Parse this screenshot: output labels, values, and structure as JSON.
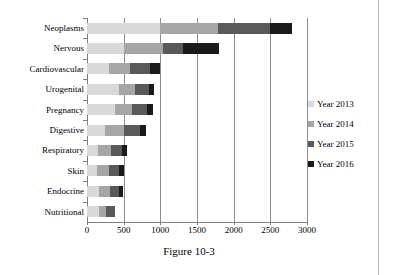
{
  "figure": {
    "caption": "Figure 10-3"
  },
  "legend": {
    "position": "right",
    "items": [
      {
        "label": "Year 2013",
        "color": "#d9d9d9",
        "icon": "square-swatch-icon"
      },
      {
        "label": "Year 2014",
        "color": "#a6a6a6",
        "icon": "square-swatch-icon"
      },
      {
        "label": "Year 2015",
        "color": "#595959",
        "icon": "square-swatch-icon"
      },
      {
        "label": "Year 2016",
        "color": "#1a1a1a",
        "icon": "square-swatch-icon"
      }
    ]
  },
  "axis": {
    "x_ticks": [
      "0",
      "500",
      "1000",
      "1500",
      "2000",
      "2500",
      "3000"
    ],
    "y_categories": [
      "Neoplasms",
      "Nervous",
      "Cardiovascular",
      "Urogenital",
      "Pregnancy",
      "Digestive",
      "Respiratory",
      "Skin",
      "Endocrine",
      "Nutritional"
    ]
  },
  "chart_data": {
    "type": "bar",
    "orientation": "horizontal",
    "stacked": true,
    "title": "",
    "subtitle": "",
    "xlabel": "",
    "ylabel": "",
    "xlim": [
      0,
      3000
    ],
    "xticks": [
      0,
      500,
      1000,
      1500,
      2000,
      2500,
      3000
    ],
    "grid": "vertical",
    "legend_position": "right",
    "categories": [
      "Neoplasms",
      "Nervous",
      "Cardiovascular",
      "Urogenital",
      "Pregnancy",
      "Digestive",
      "Respiratory",
      "Skin",
      "Endocrine",
      "Nutritional"
    ],
    "series": [
      {
        "name": "Year 2013",
        "color": "#d9d9d9",
        "values": [
          1000,
          500,
          300,
          430,
          380,
          250,
          150,
          130,
          170,
          160
        ]
      },
      {
        "name": "Year 2014",
        "color": "#a6a6a6",
        "values": [
          780,
          530,
          280,
          230,
          230,
          250,
          180,
          170,
          150,
          100
        ]
      },
      {
        "name": "Year 2015",
        "color": "#595959",
        "values": [
          720,
          280,
          280,
          180,
          210,
          220,
          150,
          140,
          110,
          120
        ]
      },
      {
        "name": "Year 2016",
        "color": "#1a1a1a",
        "values": [
          300,
          490,
          140,
          80,
          80,
          80,
          60,
          70,
          60,
          0
        ]
      }
    ],
    "totals": [
      2800,
      1800,
      1000,
      920,
      900,
      800,
      540,
      510,
      490,
      380
    ]
  }
}
